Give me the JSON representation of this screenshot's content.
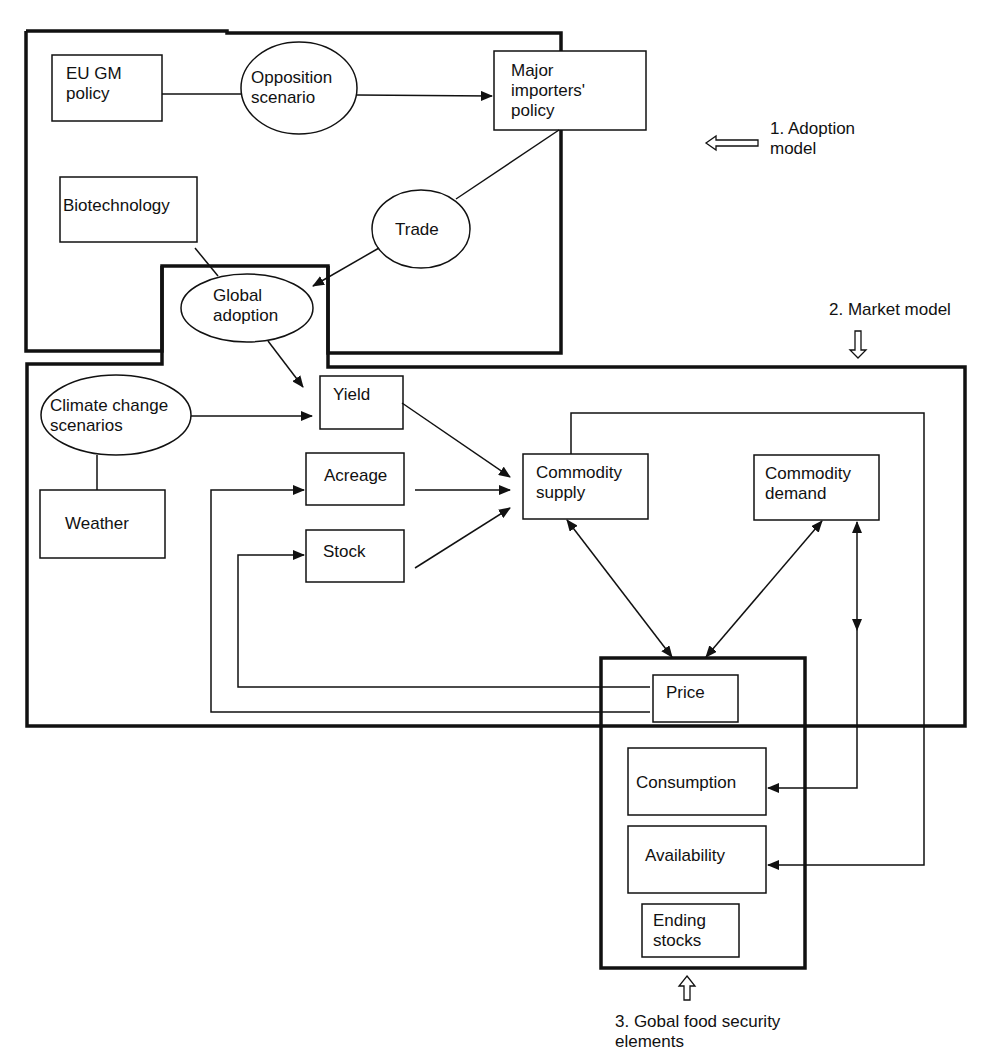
{
  "diagram": {
    "sections": {
      "adoption_model": "1. Adoption model",
      "adoption_model_line1": "1. Adoption",
      "adoption_model_line2": "model",
      "market_model": "2. Market model",
      "food_security_line1": "3. Gobal food security",
      "food_security_line2": "elements"
    },
    "nodes": {
      "eu_gm_policy": [
        "EU GM",
        "policy"
      ],
      "opposition_scenario": [
        "Opposition",
        "scenario"
      ],
      "major_importers_policy": [
        "Major",
        "importers'",
        "policy"
      ],
      "biotechnology": [
        "Biotechnology"
      ],
      "trade": [
        "Trade"
      ],
      "global_adoption": [
        "Global",
        "adoption"
      ],
      "climate_change_scenarios": [
        "Climate change",
        "scenarios"
      ],
      "weather": [
        "Weather"
      ],
      "yield": [
        "Yield"
      ],
      "acreage": [
        "Acreage"
      ],
      "stock": [
        "Stock"
      ],
      "commodity_supply": [
        "Commodity",
        "supply"
      ],
      "commodity_demand": [
        "Commodity",
        "demand"
      ],
      "price": [
        "Price"
      ],
      "consumption": [
        "Consumption"
      ],
      "availability": [
        "Availability"
      ],
      "ending_stocks": [
        "Ending",
        "stocks"
      ]
    },
    "edges": [
      {
        "from": "EU GM policy",
        "to": "Opposition scenario",
        "type": "line"
      },
      {
        "from": "Opposition scenario",
        "to": "Major importers' policy",
        "type": "arrow"
      },
      {
        "from": "Major importers' policy",
        "to": "Trade",
        "type": "line"
      },
      {
        "from": "Trade",
        "to": "Global adoption",
        "type": "arrow"
      },
      {
        "from": "Biotechnology",
        "to": "Global adoption",
        "type": "line"
      },
      {
        "from": "Global adoption",
        "to": "Yield",
        "type": "arrow"
      },
      {
        "from": "Climate change scenarios",
        "to": "Yield",
        "type": "arrow"
      },
      {
        "from": "Climate change scenarios",
        "to": "Weather",
        "type": "line"
      },
      {
        "from": "Yield",
        "to": "Commodity supply",
        "type": "arrow"
      },
      {
        "from": "Acreage",
        "to": "Commodity supply",
        "type": "arrow"
      },
      {
        "from": "Stock",
        "to": "Commodity supply",
        "type": "arrow"
      },
      {
        "from": "Commodity supply",
        "to": "Price",
        "type": "bidirectional"
      },
      {
        "from": "Commodity demand",
        "to": "Price",
        "type": "bidirectional"
      },
      {
        "from": "Commodity demand",
        "to": "Consumption",
        "type": "bidirectional"
      },
      {
        "from": "Commodity supply",
        "to": "Availability",
        "type": "arrow"
      },
      {
        "from": "Price",
        "to": "Acreage",
        "type": "arrow"
      },
      {
        "from": "Price",
        "to": "Stock",
        "type": "arrow"
      }
    ]
  }
}
